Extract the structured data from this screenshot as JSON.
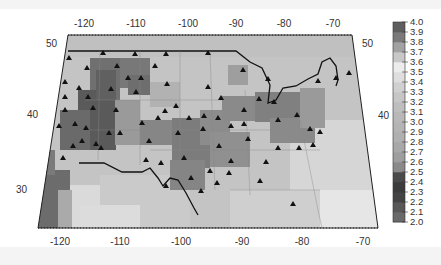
{
  "map": {
    "projection": "conic (trapezoidal frame)",
    "top_lon_ticks": [
      "-120",
      "-110",
      "-100",
      "-90",
      "-80",
      "-70"
    ],
    "bottom_lon_ticks": [
      "-120",
      "-110",
      "-100",
      "-90",
      "-80",
      "-70"
    ],
    "left_lat_ticks": [
      "50",
      "40",
      "30"
    ],
    "right_lat_ticks": [
      "50",
      "40"
    ],
    "marker": "black triangle (station)",
    "station_count_approx": 80
  },
  "colorbar": {
    "min": "2.0",
    "max": "4.0",
    "labels": [
      "4.0",
      "3.9",
      "3.8",
      "3.7",
      "3.6",
      "3.5",
      "3.4",
      "3.3",
      "3.2",
      "3.1",
      "3.0",
      "2.9",
      "2.8",
      "2.7",
      "2.6",
      "2.5",
      "2.4",
      "2.3",
      "2.2",
      "2.1",
      "2.0"
    ],
    "colors": [
      "#5e5e5e",
      "#7a7a7a",
      "#a2a2a2",
      "#c8c8c8",
      "#ececec",
      "#dedede",
      "#d0d0d0",
      "#c6c6c6",
      "#bebebe",
      "#b8b8b8",
      "#b4b4b4",
      "#b0b0b0",
      "#a8a8a8",
      "#9e9e9e",
      "#8a8a8a",
      "#4a4a4a",
      "#3c3c3c",
      "#444444",
      "#585858",
      "#6a6a6a"
    ]
  },
  "chart_data": {
    "type": "heatmap",
    "title": "",
    "xlabel": "Longitude",
    "ylabel": "Latitude",
    "x_ticks": [
      -120,
      -110,
      -100,
      -90,
      -80,
      -70
    ],
    "y_ticks": [
      30,
      40,
      50
    ],
    "colorbar_range": [
      2.0,
      4.0
    ],
    "colorbar_step": 0.1
  }
}
